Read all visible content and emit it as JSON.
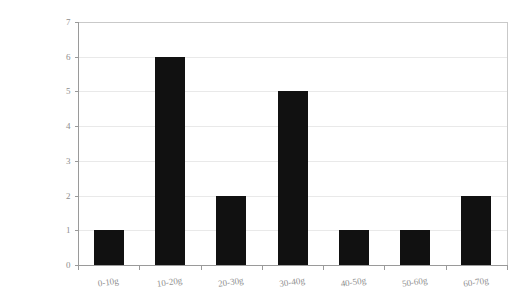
{
  "chart_data": {
    "type": "bar",
    "title": "",
    "subtitle": "",
    "xlabel": "",
    "ylabel": "",
    "categories": [
      "0-10g",
      "10-20g",
      "20-30g",
      "30-40g",
      "40-50g",
      "50-60g",
      "60-70g"
    ],
    "values": [
      1,
      6,
      2,
      5,
      1,
      1,
      2
    ],
    "ylim": [
      0,
      7
    ],
    "yticks": [
      0,
      1,
      2,
      3,
      4,
      5,
      6,
      7
    ],
    "ytick_labels": [
      "0",
      "1",
      "2",
      "3",
      "4",
      "5",
      "6",
      "7"
    ],
    "grid": true,
    "grid_axis": "y",
    "legend": false,
    "legend_position": "none",
    "bar_color": "#111111",
    "grid_color": "#e9e9e9",
    "axis_color": "#9a9a9a",
    "frame_color": "#c9c9c9",
    "tick_label_color": "#8e8e8e",
    "background_color": "#ffffff",
    "xtick_label_rotation": -8
  },
  "layout": {
    "plot_left": 78,
    "plot_right": 507,
    "plot_top": 22,
    "plot_bottom": 265,
    "bar_width_px": 30,
    "xtick_label_y": 285
  }
}
